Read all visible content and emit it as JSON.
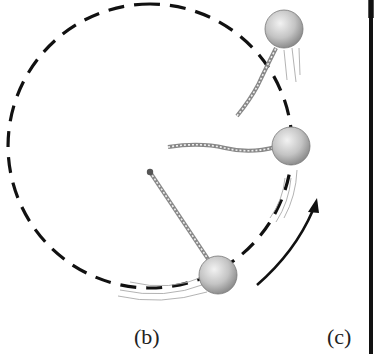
{
  "figure": {
    "panel_labels": {
      "b": "(b)",
      "c": "(c)"
    },
    "elements": {
      "circular_path": "dashed-circle",
      "pivot": "pivot-point",
      "balls": [
        "ball-bottom",
        "ball-right",
        "ball-top-released"
      ],
      "motion_arrow": "curved-arrow-counterclockwise"
    },
    "colors": {
      "path": "#111111",
      "ball": "#b8b8b8",
      "string": "#9a9a9a"
    }
  }
}
